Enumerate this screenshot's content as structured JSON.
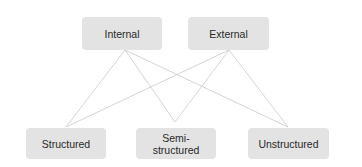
{
  "diagram": {
    "type": "bipartite-connection",
    "top_nodes": [
      {
        "id": "internal",
        "label": "Internal"
      },
      {
        "id": "external",
        "label": "External"
      }
    ],
    "bottom_nodes": [
      {
        "id": "structured",
        "label": "Structured"
      },
      {
        "id": "semi",
        "label": "Semi-\nstructured"
      },
      {
        "id": "unstructured",
        "label": "Unstructured"
      }
    ],
    "edges": [
      [
        "internal",
        "structured"
      ],
      [
        "internal",
        "semi"
      ],
      [
        "internal",
        "unstructured"
      ],
      [
        "external",
        "structured"
      ],
      [
        "external",
        "semi"
      ],
      [
        "external",
        "unstructured"
      ]
    ],
    "colors": {
      "box_fill": "#e3e3e3",
      "line": "#cfcfcf",
      "text": "#2a2a2a"
    }
  }
}
